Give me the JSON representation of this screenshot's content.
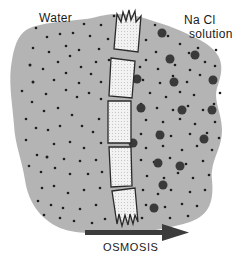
{
  "labels": {
    "left_side": "Water",
    "right_side_line1": "Na Cl",
    "right_side_line2": "solution",
    "process": "OSMOSIS"
  },
  "colors": {
    "background": "#ffffff",
    "solution_fill": "#b4b4b4",
    "small_particle": "#1e1e1e",
    "large_particle": "#3a3a3a",
    "membrane_fill": "#ebebeb",
    "membrane_stroke": "#2a2a2a",
    "arrow": "#3c3c3c"
  },
  "diagram": {
    "membrane_segments": 5,
    "arrow_direction": "left-to-right",
    "particles": {
      "small": "water molecules (both sides)",
      "large": "solute ions (NaCl side only)"
    }
  }
}
